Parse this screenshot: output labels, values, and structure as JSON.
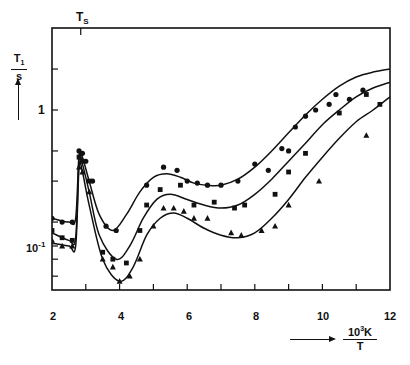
{
  "chart_data": {
    "type": "line",
    "title": "",
    "xlabel": "10^3K / T",
    "ylabel": "T1 / s",
    "xscale": "linear",
    "yscale": "log",
    "xlim": [
      2,
      12
    ],
    "ylim": [
      0.046,
      4.0
    ],
    "x_ticks": [
      "2",
      "4",
      "6",
      "8",
      "10",
      "12"
    ],
    "y_tick_labels": [
      "10^-1",
      "1"
    ],
    "annotations": [
      {
        "text": "T_S",
        "x": 2.85,
        "position": "top axis tick"
      }
    ],
    "grid": false,
    "legend": null,
    "series": [
      {
        "name": "circles (upper)",
        "marker": "circle",
        "fit_curve": {
          "x": [
            2.0,
            2.5,
            2.7,
            2.8,
            2.9,
            3.1,
            3.4,
            3.8,
            4.2,
            4.6,
            5.0,
            5.4,
            5.8,
            6.2,
            6.6,
            7.0,
            7.5,
            8.0,
            8.5,
            9.0,
            9.5,
            10.0,
            10.5,
            11.0,
            11.5,
            12.0
          ],
          "y": [
            0.16,
            0.15,
            0.16,
            0.47,
            0.45,
            0.3,
            0.17,
            0.13,
            0.17,
            0.25,
            0.32,
            0.34,
            0.32,
            0.29,
            0.28,
            0.28,
            0.31,
            0.38,
            0.5,
            0.68,
            0.92,
            1.2,
            1.5,
            1.75,
            1.9,
            2.0
          ]
        },
        "points": {
          "x": [
            2.0,
            2.3,
            2.6,
            2.8,
            2.9,
            3.0,
            3.2,
            3.6,
            3.9,
            4.8,
            5.3,
            5.7,
            6.0,
            6.3,
            6.6,
            7.0,
            7.5,
            8.0,
            8.4,
            8.8,
            9.0,
            9.2,
            9.5,
            9.8,
            10.2,
            10.4,
            10.8,
            11.2
          ],
          "y": [
            0.16,
            0.15,
            0.15,
            0.5,
            0.48,
            0.42,
            0.3,
            0.14,
            0.13,
            0.28,
            0.38,
            0.36,
            0.3,
            0.29,
            0.28,
            0.28,
            0.3,
            0.4,
            0.36,
            0.52,
            0.5,
            0.75,
            0.9,
            1.0,
            1.1,
            1.3,
            1.2,
            1.4
          ]
        }
      },
      {
        "name": "squares (middle)",
        "marker": "square",
        "fit_curve": {
          "x": [
            2.0,
            2.5,
            2.7,
            2.8,
            2.9,
            3.1,
            3.4,
            3.9,
            4.3,
            4.7,
            5.1,
            5.5,
            6.0,
            6.5,
            7.0,
            7.5,
            8.0,
            8.5,
            9.0,
            9.5,
            10.0,
            10.5,
            11.0,
            11.5,
            12.0
          ],
          "y": [
            0.125,
            0.11,
            0.115,
            0.43,
            0.4,
            0.25,
            0.12,
            0.08,
            0.1,
            0.16,
            0.22,
            0.24,
            0.22,
            0.2,
            0.19,
            0.2,
            0.24,
            0.31,
            0.42,
            0.57,
            0.78,
            1.0,
            1.25,
            1.45,
            1.6
          ]
        },
        "points": {
          "x": [
            2.0,
            2.3,
            2.6,
            2.8,
            2.9,
            3.1,
            3.5,
            3.8,
            4.2,
            4.6,
            4.8,
            5.2,
            5.8,
            6.2,
            6.8,
            7.4,
            7.7,
            8.6,
            9.0,
            9.5,
            10.5,
            11.3,
            11.7
          ],
          "y": [
            0.13,
            0.115,
            0.11,
            0.45,
            0.42,
            0.3,
            0.09,
            0.08,
            0.075,
            0.13,
            0.2,
            0.26,
            0.28,
            0.2,
            0.21,
            0.19,
            0.2,
            0.24,
            0.35,
            0.48,
            0.95,
            1.3,
            1.1
          ]
        }
      },
      {
        "name": "triangles (lower)",
        "marker": "triangle",
        "fit_curve": {
          "x": [
            2.0,
            2.5,
            2.7,
            2.8,
            2.9,
            3.1,
            3.5,
            4.0,
            4.4,
            4.8,
            5.2,
            5.6,
            6.0,
            6.5,
            7.0,
            7.5,
            8.0,
            8.5,
            9.0,
            9.5,
            10.0,
            10.5,
            11.0,
            11.5,
            12.0
          ],
          "y": [
            0.105,
            0.1,
            0.1,
            0.38,
            0.35,
            0.2,
            0.08,
            0.055,
            0.07,
            0.12,
            0.16,
            0.175,
            0.16,
            0.135,
            0.12,
            0.115,
            0.125,
            0.16,
            0.22,
            0.32,
            0.45,
            0.62,
            0.82,
            1.0,
            1.25
          ]
        },
        "points": {
          "x": [
            2.0,
            2.3,
            2.6,
            2.8,
            2.9,
            3.1,
            3.5,
            3.8,
            4.0,
            4.3,
            4.6,
            5.0,
            5.3,
            5.6,
            5.9,
            6.2,
            6.6,
            7.3,
            7.6,
            8.2,
            8.6,
            9.0,
            9.9,
            11.3
          ],
          "y": [
            0.11,
            0.1,
            0.1,
            0.38,
            0.35,
            0.25,
            0.08,
            0.07,
            0.055,
            0.06,
            0.08,
            0.14,
            0.19,
            0.19,
            0.18,
            0.16,
            0.16,
            0.125,
            0.12,
            0.13,
            0.14,
            0.2,
            0.3,
            0.65
          ]
        }
      }
    ]
  },
  "axes": {
    "y_label_num": "T",
    "y_label_num_sub": "1",
    "y_label_den": "s",
    "y_tick_1": "1",
    "y_tick_01": "10",
    "y_tick_01_exp": "-1",
    "x_label_num": "10",
    "x_label_num_exp": "3",
    "x_label_num_unit": "K",
    "x_label_den": "T",
    "ts_label": "T",
    "ts_sub": "S",
    "x_ticks": [
      "2",
      "4",
      "6",
      "8",
      "10",
      "12"
    ]
  }
}
